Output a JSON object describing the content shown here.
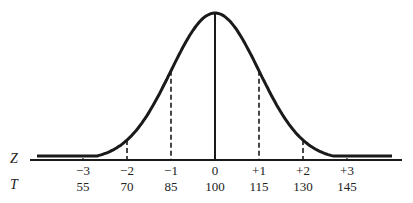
{
  "chart_data": {
    "type": "line",
    "title": "",
    "xlabel": "",
    "ylabel": "",
    "grid": false,
    "axes_rows": [
      {
        "name": "Z",
        "ticks": [
          "−3",
          "−2",
          "−1",
          "0",
          "+1",
          "+2",
          "+3"
        ]
      },
      {
        "name": "T",
        "ticks": [
          "55",
          "70",
          "85",
          "100",
          "115",
          "130",
          "145"
        ]
      }
    ],
    "z_values": [
      -3,
      -2,
      -1,
      0,
      1,
      2,
      3
    ],
    "t_values": [
      55,
      70,
      85,
      100,
      115,
      130,
      145
    ],
    "mean": 0,
    "sd": 1,
    "reference_lines": [
      {
        "z": -3,
        "style": "dashed"
      },
      {
        "z": -2,
        "style": "dashed"
      },
      {
        "z": -1,
        "style": "dashed"
      },
      {
        "z": 0,
        "style": "solid"
      },
      {
        "z": 1,
        "style": "dashed"
      },
      {
        "z": 2,
        "style": "dashed"
      },
      {
        "z": 3,
        "style": "dashed"
      }
    ],
    "curve_color": "#1a1a1a"
  },
  "labels": {
    "z_axis": "Z",
    "t_axis": "T"
  }
}
